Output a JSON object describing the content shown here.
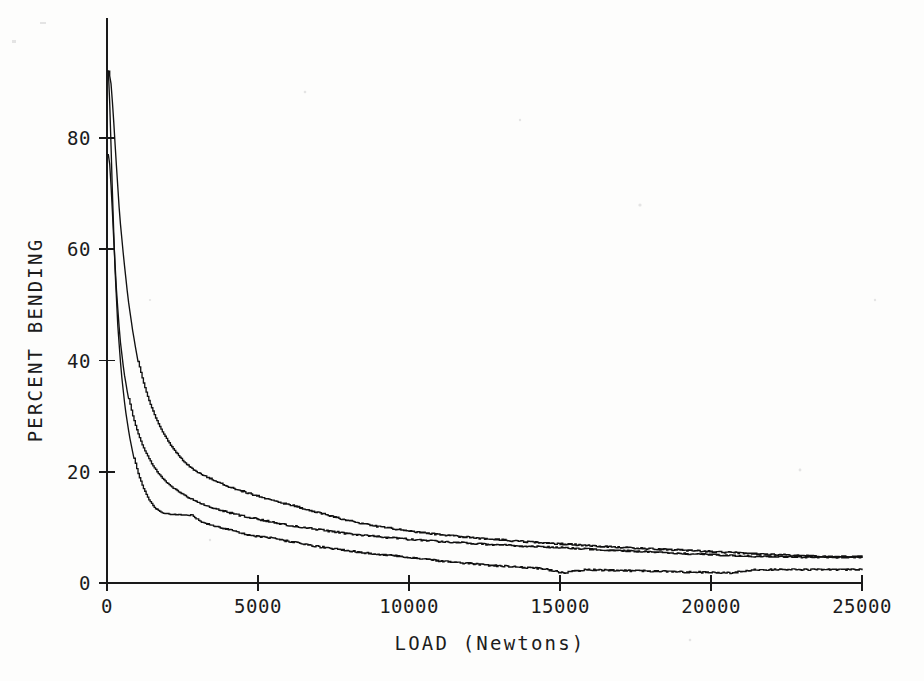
{
  "chart_data": {
    "type": "line",
    "title": "",
    "xlabel": "LOAD  (Newtons)",
    "ylabel": "PERCENT BENDING",
    "xlim": [
      0,
      25000
    ],
    "ylim": [
      0,
      92
    ],
    "grid": false,
    "legend": "none",
    "xticks": [
      0,
      5000,
      10000,
      15000,
      20000,
      25000
    ],
    "xtick_labels": [
      "0",
      "5000",
      "10000",
      "15000",
      "20000",
      "25000"
    ],
    "yticks": [
      0,
      20,
      40,
      60,
      80
    ],
    "ytick_labels": [
      "0",
      "20",
      "40",
      "60",
      "80"
    ],
    "series": [
      {
        "name": "upper",
        "x": [
          60,
          130,
          200,
          300,
          420,
          560,
          700,
          860,
          1020,
          1200,
          1400,
          1620,
          1850,
          2100,
          2350,
          2600,
          2850,
          3100,
          3400,
          3700,
          4000,
          4300,
          4650,
          5000,
          5350,
          5700,
          6100,
          6500,
          6900,
          7300,
          7700,
          8100,
          8500,
          8900,
          9300,
          9700,
          10200,
          10700,
          11200,
          11800,
          12400,
          13000,
          13600,
          14200,
          14800,
          15500,
          16200,
          17000,
          17800,
          18600,
          19400,
          20200,
          21000,
          22000,
          23000,
          24000,
          25000
        ],
        "y": [
          92,
          90,
          85,
          76,
          66,
          58,
          51,
          45,
          40,
          36,
          32.5,
          29.5,
          27,
          24.8,
          23,
          21.5,
          20.4,
          19.6,
          18.8,
          18.1,
          17.4,
          16.8,
          16.2,
          15.6,
          15.0,
          14.5,
          14.0,
          13.4,
          12.8,
          12.2,
          11.6,
          11.1,
          10.6,
          10.2,
          9.9,
          9.6,
          9.2,
          8.9,
          8.6,
          8.3,
          8.0,
          7.8,
          7.5,
          7.3,
          7.1,
          6.9,
          6.6,
          6.4,
          6.2,
          6.0,
          5.8,
          5.6,
          5.4,
          5.1,
          4.9,
          4.8,
          4.7
        ]
      },
      {
        "name": "middle",
        "x": [
          70,
          150,
          230,
          320,
          430,
          560,
          700,
          850,
          1000,
          1150,
          1300,
          1480,
          1680,
          1900,
          2150,
          2400,
          2650,
          2900,
          3150,
          3400,
          3700,
          4000,
          4350,
          4700,
          5050,
          5400,
          5800,
          6200,
          6600,
          7000,
          7400,
          7800,
          8200,
          8600,
          9000,
          9400,
          9900,
          10400,
          10900,
          11500,
          12100,
          12700,
          13300,
          13900,
          14500,
          15200,
          15900,
          16700,
          17500,
          18300,
          19100,
          19900,
          20700,
          21600,
          22600,
          23600,
          25000
        ],
        "y": [
          77,
          70,
          61,
          52,
          44,
          38,
          33.5,
          30,
          27.2,
          25,
          23.2,
          21.4,
          19.8,
          18.4,
          17.2,
          16.3,
          15.5,
          14.8,
          14.2,
          13.7,
          13.2,
          12.7,
          12.2,
          11.8,
          11.4,
          11.0,
          10.6,
          10.2,
          9.9,
          9.6,
          9.3,
          9.0,
          8.7,
          8.5,
          8.3,
          8.1,
          7.9,
          7.7,
          7.5,
          7.3,
          7.1,
          6.9,
          6.8,
          6.6,
          6.5,
          6.3,
          6.1,
          5.9,
          5.7,
          5.5,
          5.3,
          5.1,
          4.9,
          4.8,
          4.7,
          4.6,
          4.6
        ]
      },
      {
        "name": "lower",
        "x": [
          55,
          110,
          180,
          260,
          360,
          470,
          600,
          740,
          890,
          1050,
          1220,
          1400,
          1600,
          1820,
          2050,
          2300,
          2550,
          2800,
          3050,
          3300,
          3600,
          3900,
          4250,
          4600,
          4950,
          5300,
          5700,
          6100,
          6500,
          6900,
          7300,
          7700,
          8100,
          8500,
          8900,
          9300,
          9800,
          10300,
          10800,
          11400,
          12000,
          12600,
          13200,
          13800,
          14400,
          15100,
          15800,
          16600,
          17400,
          18200,
          19000,
          19800,
          20600,
          21500,
          22500,
          23500,
          25000
        ],
        "y": [
          92,
          83,
          70,
          57,
          46,
          38,
          31.5,
          26.5,
          22.5,
          19.2,
          16.8,
          14.8,
          13.4,
          12.6,
          12.4,
          12.3,
          12.3,
          12.2,
          11.2,
          10.6,
          10.2,
          9.8,
          9.3,
          8.7,
          8.4,
          8.2,
          7.8,
          7.4,
          7.0,
          6.6,
          6.3,
          6.0,
          5.7,
          5.4,
          5.2,
          5.0,
          4.7,
          4.4,
          4.1,
          3.8,
          3.5,
          3.2,
          3.0,
          2.8,
          2.6,
          1.8,
          2.4,
          2.3,
          2.2,
          2.1,
          2.0,
          1.9,
          1.8,
          2.4,
          2.4,
          2.4,
          2.4
        ]
      }
    ]
  },
  "colors": {
    "background": "#fdfdfc",
    "ink": "#111111",
    "axis": "#1a1a1a"
  }
}
